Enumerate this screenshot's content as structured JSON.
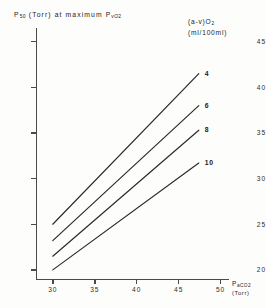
{
  "chart_data": {
    "type": "line",
    "title": "",
    "ylabel": "P50 (Torr) at maximum PvO2",
    "ylabel_parts": {
      "p": "P",
      "p_sub": "50",
      "mid": " (Torr) at maximum P",
      "v_sub": "vO",
      "v_sub2": "2"
    },
    "xlabel": "PaCO2 (Torr)",
    "xlabel_parts": {
      "p": "P",
      "p_sub": "aCO",
      "p_sub2": "2",
      "unit": "(Torr)"
    },
    "xlim": [
      28,
      51
    ],
    "ylim": [
      19,
      46.5
    ],
    "xticks": [
      30,
      35,
      40,
      45,
      50
    ],
    "yticks": [
      45,
      40,
      35,
      30,
      25,
      20
    ],
    "grid": false,
    "legend_position": "top-right",
    "legend_title_line1": "(a-v)O2",
    "legend_title_line2": "(ml/100ml)",
    "legend_parts": {
      "open": "(a-v)O",
      "sub": "2",
      "units": "(ml/100ml)"
    },
    "series": [
      {
        "name": "4",
        "label": "4",
        "x": [
          30,
          47.4
        ],
        "y": [
          25.0,
          41.5
        ]
      },
      {
        "name": "6",
        "label": "6",
        "x": [
          30,
          47.4
        ],
        "y": [
          23.2,
          38.0
        ]
      },
      {
        "name": "8",
        "label": "8",
        "x": [
          30,
          47.4
        ],
        "y": [
          21.5,
          35.3
        ]
      },
      {
        "name": "10",
        "label": "10",
        "x": [
          30,
          47.4
        ],
        "y": [
          20.0,
          31.7
        ]
      }
    ],
    "colors": {
      "line": "#2b2b2b",
      "axis": "#4a4a4a",
      "text": "#222222",
      "background": "#fdfdfc"
    }
  }
}
